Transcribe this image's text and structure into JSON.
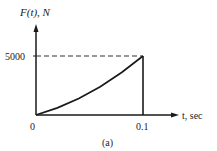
{
  "chart_data": {
    "type": "line",
    "title": "",
    "caption": "(a)",
    "xlabel": "t, sec",
    "ylabel": "F(t), N",
    "x_ticks": [
      "0",
      "0.1"
    ],
    "y_ticks": [
      "5000"
    ],
    "xlim": [
      0,
      0.1
    ],
    "ylim": [
      0,
      5000
    ],
    "grid": false,
    "legend": null,
    "series": [
      {
        "name": "F(t)",
        "x": [
          0,
          0.02,
          0.04,
          0.06,
          0.08,
          0.1
        ],
        "values": [
          0,
          600,
          1400,
          2400,
          3600,
          5000
        ]
      }
    ],
    "annotations": [
      {
        "type": "dashed-hline",
        "y": 5000,
        "x_range": [
          0,
          0.1
        ]
      },
      {
        "type": "vline",
        "x": 0.1,
        "y_range": [
          0,
          5000
        ]
      }
    ]
  },
  "labels": {
    "y_axis": "F(t), N",
    "x_axis": "t, sec",
    "y_tick_5000": "5000",
    "x_tick_0": "0",
    "x_tick_01": "0.1",
    "caption": "(a)"
  },
  "colors": {
    "line": "#1a1a1a",
    "text": "#222222",
    "background": "#ffffff"
  }
}
